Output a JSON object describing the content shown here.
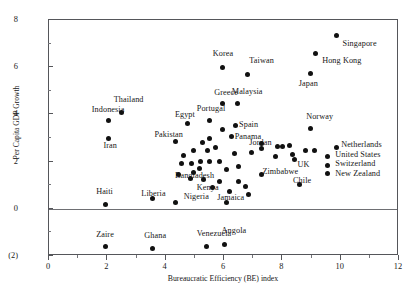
{
  "chart_data": {
    "type": "scatter",
    "title": "",
    "xlabel": "Bureaucratic Efficiency (BE) index",
    "ylabel": "Per Capita GDP Growth",
    "xlim": [
      0,
      12
    ],
    "ylim": [
      -2,
      8
    ],
    "xticks": [
      "0",
      "2",
      "4",
      "6",
      "8",
      "10",
      "12"
    ],
    "xtick_values": [
      0,
      2,
      4,
      6,
      8,
      10,
      12
    ],
    "yticks": [
      "8",
      "6",
      "4",
      "2",
      "0",
      "(2)"
    ],
    "ytick_values": [
      8,
      6,
      4,
      2,
      0,
      -2
    ],
    "grid": false,
    "legend": "none",
    "zero_reference_line": 0,
    "marker": "filled-circle",
    "marker_color": "#111111",
    "points": [
      {
        "label": "Singapore",
        "x": 9.85,
        "y": 7.35,
        "lx": 10.1,
        "ly": 6.95
      },
      {
        "label": "Hong Kong",
        "x": 9.15,
        "y": 6.6,
        "lx": 9.4,
        "ly": 6.2
      },
      {
        "label": "Japan",
        "x": 8.95,
        "y": 5.75,
        "lx": 8.6,
        "ly": 5.25
      },
      {
        "label": "Korea",
        "x": 5.95,
        "y": 6.0,
        "lx": 5.65,
        "ly": 6.5
      },
      {
        "label": "Taiwan",
        "x": 6.8,
        "y": 5.7,
        "lx": 6.9,
        "ly": 6.2
      },
      {
        "label": "Greece",
        "x": 5.95,
        "y": 4.45,
        "lx": 5.7,
        "ly": 4.85
      },
      {
        "label": "Malaysia",
        "x": 6.45,
        "y": 4.45,
        "lx": 6.3,
        "ly": 4.9
      },
      {
        "label": "Thailand",
        "x": 2.5,
        "y": 4.1,
        "lx": 2.25,
        "ly": 4.55
      },
      {
        "label": "Indonesia",
        "x": 2.05,
        "y": 3.75,
        "lx": 1.5,
        "ly": 4.15
      },
      {
        "label": "Portugal",
        "x": 5.5,
        "y": 3.75,
        "lx": 5.1,
        "ly": 4.2
      },
      {
        "label": "Egypt",
        "x": 4.75,
        "y": 3.6,
        "lx": 4.35,
        "ly": 3.95
      },
      {
        "label": "Spain",
        "x": 6.4,
        "y": 3.55,
        "lx": 6.55,
        "ly": 3.5
      },
      {
        "label": "Norway",
        "x": 8.95,
        "y": 3.4,
        "lx": 8.85,
        "ly": 3.85
      },
      {
        "label": "Panama",
        "x": 6.25,
        "y": 3.05,
        "lx": 6.4,
        "ly": 3.0
      },
      {
        "label": "Iran",
        "x": 2.05,
        "y": 3.0,
        "lx": 1.9,
        "ly": 2.6
      },
      {
        "label": "Pakistan",
        "x": 4.35,
        "y": 2.85,
        "lx": 3.65,
        "ly": 3.1
      },
      {
        "label": "Jordan",
        "x": 6.95,
        "y": 2.4,
        "lx": 6.9,
        "ly": 2.75
      },
      {
        "label": "Netherlands",
        "x": 9.85,
        "y": 2.6,
        "lx": 10.05,
        "ly": 2.65
      },
      {
        "label": "United States",
        "x": 9.55,
        "y": 2.2,
        "lx": 9.85,
        "ly": 2.25
      },
      {
        "label": "Switzerland",
        "x": 9.55,
        "y": 1.85,
        "lx": 9.85,
        "ly": 1.85
      },
      {
        "label": "New Zealand",
        "x": 9.55,
        "y": 1.5,
        "lx": 9.85,
        "ly": 1.45
      },
      {
        "label": "UK",
        "x": 8.4,
        "y": 2.1,
        "lx": 8.55,
        "ly": 1.8
      },
      {
        "label": "Zimbabwe",
        "x": 7.3,
        "y": 1.45,
        "lx": 7.35,
        "ly": 1.5
      },
      {
        "label": "Chile",
        "x": 8.6,
        "y": 1.05,
        "lx": 8.4,
        "ly": 1.15
      },
      {
        "label": "Bangladesh",
        "x": 4.95,
        "y": 1.55,
        "lx": 4.35,
        "ly": 1.35
      },
      {
        "label": "Kenya",
        "x": 5.6,
        "y": 0.9,
        "lx": 5.1,
        "ly": 0.85
      },
      {
        "label": "Nigeria",
        "x": 4.35,
        "y": 0.25,
        "lx": 4.65,
        "ly": 0.45
      },
      {
        "label": "Jamaica",
        "x": 6.1,
        "y": 0.25,
        "lx": 5.8,
        "ly": 0.4
      },
      {
        "label": "Liberia",
        "x": 3.55,
        "y": 0.45,
        "lx": 3.2,
        "ly": 0.6
      },
      {
        "label": "Haiti",
        "x": 1.95,
        "y": 0.2,
        "lx": 1.65,
        "ly": 0.65
      },
      {
        "label": "Zaire",
        "x": 1.95,
        "y": -1.6,
        "lx": 1.65,
        "ly": -1.15
      },
      {
        "label": "Ghana",
        "x": 3.55,
        "y": -1.7,
        "lx": 3.3,
        "ly": -1.2
      },
      {
        "label": "Venezuela",
        "x": 5.4,
        "y": -1.6,
        "lx": 5.1,
        "ly": -1.1
      },
      {
        "label": "Angola",
        "x": 6.0,
        "y": -1.5,
        "lx": 5.95,
        "ly": -1.0
      },
      {
        "label": "",
        "x": 5.2,
        "y": 2.0,
        "lx": null,
        "ly": null
      },
      {
        "label": "",
        "x": 5.45,
        "y": 2.45,
        "lx": null,
        "ly": null
      },
      {
        "label": "",
        "x": 5.7,
        "y": 2.6,
        "lx": null,
        "ly": null
      },
      {
        "label": "",
        "x": 5.5,
        "y": 3.0,
        "lx": null,
        "ly": null
      },
      {
        "label": "",
        "x": 5.25,
        "y": 2.8,
        "lx": null,
        "ly": null
      },
      {
        "label": "",
        "x": 5.95,
        "y": 3.35,
        "lx": null,
        "ly": null
      },
      {
        "label": "",
        "x": 4.95,
        "y": 2.45,
        "lx": null,
        "ly": null
      },
      {
        "label": "",
        "x": 4.9,
        "y": 1.9,
        "lx": null,
        "ly": null
      },
      {
        "label": "",
        "x": 5.15,
        "y": 1.7,
        "lx": null,
        "ly": null
      },
      {
        "label": "",
        "x": 5.5,
        "y": 2.0,
        "lx": null,
        "ly": null
      },
      {
        "label": "",
        "x": 5.85,
        "y": 2.0,
        "lx": null,
        "ly": null
      },
      {
        "label": "",
        "x": 6.1,
        "y": 1.65,
        "lx": null,
        "ly": null
      },
      {
        "label": "",
        "x": 5.85,
        "y": 1.15,
        "lx": null,
        "ly": null
      },
      {
        "label": "",
        "x": 5.3,
        "y": 1.25,
        "lx": null,
        "ly": null
      },
      {
        "label": "",
        "x": 4.85,
        "y": 1.3,
        "lx": null,
        "ly": null
      },
      {
        "label": "",
        "x": 6.35,
        "y": 2.35,
        "lx": null,
        "ly": null
      },
      {
        "label": "",
        "x": 6.5,
        "y": 1.8,
        "lx": null,
        "ly": null
      },
      {
        "label": "",
        "x": 6.5,
        "y": 1.15,
        "lx": null,
        "ly": null
      },
      {
        "label": "",
        "x": 6.2,
        "y": 0.75,
        "lx": null,
        "ly": null
      },
      {
        "label": "",
        "x": 6.75,
        "y": 0.95,
        "lx": null,
        "ly": null
      },
      {
        "label": "",
        "x": 6.85,
        "y": 0.6,
        "lx": null,
        "ly": null
      },
      {
        "label": "",
        "x": 7.3,
        "y": 2.75,
        "lx": null,
        "ly": null
      },
      {
        "label": "",
        "x": 7.3,
        "y": 2.55,
        "lx": null,
        "ly": null
      },
      {
        "label": "",
        "x": 7.85,
        "y": 2.65,
        "lx": null,
        "ly": null
      },
      {
        "label": "",
        "x": 8.0,
        "y": 2.65,
        "lx": null,
        "ly": null
      },
      {
        "label": "",
        "x": 8.25,
        "y": 2.7,
        "lx": null,
        "ly": null
      },
      {
        "label": "",
        "x": 7.75,
        "y": 2.2,
        "lx": null,
        "ly": null
      },
      {
        "label": "",
        "x": 8.35,
        "y": 2.3,
        "lx": null,
        "ly": null
      },
      {
        "label": "",
        "x": 8.8,
        "y": 2.45,
        "lx": null,
        "ly": null
      },
      {
        "label": "",
        "x": 9.1,
        "y": 2.45,
        "lx": null,
        "ly": null
      },
      {
        "label": "",
        "x": 4.55,
        "y": 1.9,
        "lx": null,
        "ly": null
      },
      {
        "label": "",
        "x": 4.6,
        "y": 2.25,
        "lx": null,
        "ly": null
      },
      {
        "label": "",
        "x": 4.45,
        "y": 1.45,
        "lx": null,
        "ly": null
      }
    ]
  }
}
